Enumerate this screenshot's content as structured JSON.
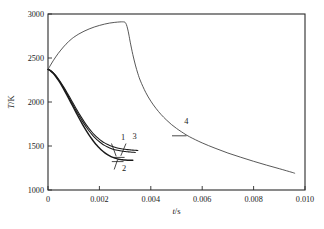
{
  "chart_data": {
    "type": "line",
    "title": "",
    "xlabel": "t/s",
    "ylabel": "T/K",
    "xlim": [
      0,
      0.01
    ],
    "ylim": [
      1000,
      3000
    ],
    "grid": false,
    "legend_position": "inline-annotations",
    "x_ticks": [
      "0",
      "0.002",
      "0.004",
      "0.006",
      "0.008",
      "0.010"
    ],
    "x_tick_values": [
      0,
      0.002,
      0.004,
      0.006,
      0.008,
      0.01
    ],
    "y_ticks": [
      "1000",
      "1500",
      "2000",
      "2500",
      "3000"
    ],
    "y_tick_values": [
      1000,
      1500,
      2000,
      2500,
      3000
    ],
    "annotations": [
      {
        "label": "1",
        "x": 0.00292,
        "y": 1570
      },
      {
        "label": "2",
        "x": 0.00296,
        "y": 1220
      },
      {
        "label": "3",
        "x": 0.00337,
        "y": 1575
      },
      {
        "label": "4",
        "x": 0.00538,
        "y": 1745
      }
    ],
    "series": [
      {
        "name": "1",
        "x": [
          0,
          5e-05,
          0.0001,
          0.0002,
          0.0003,
          0.0004,
          0.0005,
          0.0006,
          0.0007,
          0.0008,
          0.0009,
          0.001,
          0.0011,
          0.0012,
          0.0013,
          0.0014,
          0.0015,
          0.0016,
          0.0017,
          0.0018,
          0.0019,
          0.002,
          0.0021,
          0.0022,
          0.0023,
          0.0024,
          0.0025,
          0.0026,
          0.0027,
          0.0028,
          0.0029,
          0.003,
          0.0031,
          0.0032,
          0.0033,
          0.0034
        ],
        "y": [
          2370,
          2365,
          2355,
          2330,
          2296,
          2256,
          2212,
          2164,
          2113,
          2060,
          2007,
          1953,
          1900,
          1849,
          1800,
          1754,
          1711,
          1671,
          1635,
          1602,
          1573,
          1548,
          1526,
          1507,
          1491,
          1478,
          1467,
          1458,
          1451,
          1445,
          1441,
          1437,
          1434,
          1431,
          1429,
          1427
        ]
      },
      {
        "name": "2",
        "x": [
          0,
          5e-05,
          0.0001,
          0.0002,
          0.0003,
          0.0004,
          0.0005,
          0.0006,
          0.0007,
          0.0008,
          0.0009,
          0.001,
          0.0011,
          0.0012,
          0.0013,
          0.0014,
          0.0015,
          0.0016,
          0.0017,
          0.0018,
          0.0019,
          0.002,
          0.0021,
          0.0022,
          0.0023,
          0.0024,
          0.0025,
          0.0026,
          0.0027,
          0.0028,
          0.0029,
          0.003,
          0.0031,
          0.0032,
          0.0033
        ],
        "y": [
          2370,
          2364,
          2353,
          2326,
          2290,
          2248,
          2202,
          2152,
          2099,
          2044,
          1988,
          1932,
          1876,
          1821,
          1768,
          1717,
          1669,
          1624,
          1582,
          1543,
          1508,
          1477,
          1449,
          1425,
          1404,
          1387,
          1373,
          1362,
          1354,
          1348,
          1344,
          1341,
          1339,
          1338,
          1337
        ]
      },
      {
        "name": "3",
        "x": [
          0,
          5e-05,
          0.0001,
          0.0002,
          0.0003,
          0.0004,
          0.0005,
          0.0006,
          0.0007,
          0.0008,
          0.0009,
          0.001,
          0.0011,
          0.0012,
          0.0013,
          0.0014,
          0.0015,
          0.0016,
          0.0017,
          0.0018,
          0.0019,
          0.002,
          0.0021,
          0.0022,
          0.0023,
          0.0024,
          0.0025,
          0.0026,
          0.0027,
          0.0028,
          0.0029,
          0.003,
          0.0031,
          0.0032,
          0.0033,
          0.0034,
          0.0035
        ],
        "y": [
          2370,
          2366,
          2357,
          2334,
          2302,
          2264,
          2222,
          2176,
          2128,
          2077,
          2026,
          1974,
          1923,
          1873,
          1825,
          1780,
          1737,
          1698,
          1662,
          1630,
          1601,
          1576,
          1554,
          1535,
          1519,
          1506,
          1495,
          1486,
          1478,
          1472,
          1467,
          1463,
          1459,
          1456,
          1453,
          1451,
          1449
        ]
      },
      {
        "name": "4",
        "x": [
          0,
          0.0001,
          0.0002,
          0.0003,
          0.0004,
          0.0005,
          0.0006,
          0.0007,
          0.0008,
          0.0009,
          0.001,
          0.0012,
          0.0014,
          0.0016,
          0.0018,
          0.002,
          0.0022,
          0.0024,
          0.0026,
          0.0028,
          0.0029,
          0.00295,
          0.003,
          0.00305,
          0.0031,
          0.00315,
          0.0032,
          0.0033,
          0.0034,
          0.0035,
          0.0036,
          0.0038,
          0.004,
          0.0042,
          0.0044,
          0.0046,
          0.0048,
          0.005,
          0.0052,
          0.0055,
          0.006,
          0.0065,
          0.007,
          0.0075,
          0.008,
          0.0085,
          0.009,
          0.0095,
          0.0096
        ],
        "y": [
          2370,
          2420,
          2468,
          2512,
          2553,
          2590,
          2625,
          2657,
          2686,
          2712,
          2735,
          2773,
          2804,
          2830,
          2852,
          2870,
          2885,
          2897,
          2905,
          2910,
          2911,
          2910,
          2905,
          2880,
          2830,
          2760,
          2680,
          2540,
          2420,
          2320,
          2238,
          2110,
          2010,
          1928,
          1858,
          1798,
          1745,
          1700,
          1660,
          1606,
          1535,
          1475,
          1420,
          1372,
          1326,
          1283,
          1242,
          1200,
          1190
        ]
      }
    ]
  },
  "axes": {
    "x_label_italic": "t",
    "x_label_rest": "/s",
    "y_label_italic": "T",
    "y_label_rest": "/K"
  }
}
